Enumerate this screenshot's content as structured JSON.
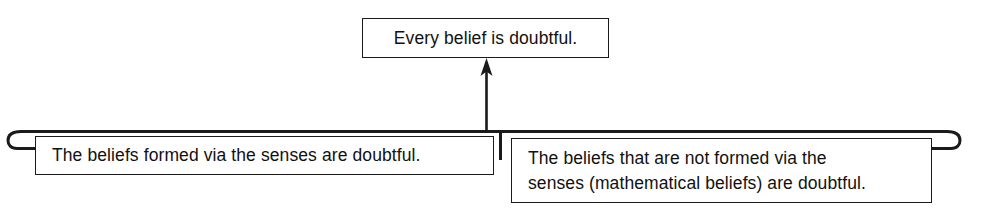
{
  "diagram": {
    "type": "argument-diagram",
    "background_color": "#ffffff",
    "line_color": "#1a1a1a",
    "text_color": "#111111",
    "conclusion": {
      "label": "Every belief is doubtful."
    },
    "premises": [
      {
        "id": "premise-one",
        "label": "The beliefs formed via the senses are doubtful."
      },
      {
        "id": "premise-two",
        "label": "The beliefs that are not formed via the\nsenses (mathematical beliefs) are doubtful."
      }
    ],
    "connectors": {
      "joint_bracket": "horizontal-bracket-with-hooked-ends",
      "arrow": "upward-arrow-to-conclusion"
    }
  }
}
